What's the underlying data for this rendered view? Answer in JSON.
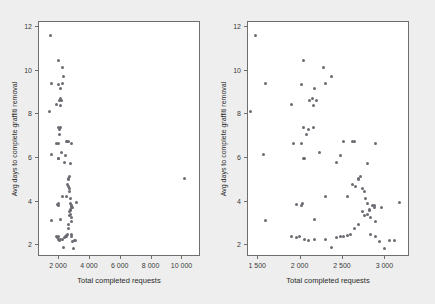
{
  "figure": {
    "background_color": "#eeeeee",
    "panel_background_color": "#ffffff",
    "point_color": "#6b6b73",
    "axis_color": "#6e6e6e"
  },
  "chart_data": [
    {
      "type": "scatter",
      "panel": "left",
      "title": "",
      "xlabel": "Total completed requests",
      "ylabel": "Avg days to complete graffiti removal",
      "xlim": [
        700,
        11200
      ],
      "ylim": [
        1.45,
        12.25
      ],
      "xticks": [
        2000,
        4000,
        6000,
        8000,
        10000
      ],
      "xtick_labels": [
        "2 000",
        "4 000",
        "6 000",
        "8 000",
        "10 000"
      ],
      "yticks": [
        2,
        4,
        6,
        8,
        10,
        12
      ],
      "ytick_labels": [
        "2",
        "4",
        "6",
        "8",
        "10",
        "12"
      ],
      "grid": false,
      "legend": "none",
      "x": [
        1480,
        1600,
        1420,
        1580,
        1900,
        2050,
        2020,
        2180,
        2280,
        2150,
        2120,
        2200,
        2160,
        2080,
        2020,
        2050,
        2300,
        2380,
        2050,
        2100,
        1930,
        2160,
        2240,
        2060,
        2480,
        2620,
        2650,
        2900,
        2440,
        2520,
        1600,
        1960,
        2020,
        2030,
        2180,
        2300,
        2560,
        2620,
        2700,
        2720,
        2740,
        2760,
        2700,
        2660,
        2780,
        2800,
        2820,
        2860,
        2880,
        2900,
        2740,
        2760,
        2800,
        2820,
        2840,
        2700,
        2650,
        2600,
        2560,
        2520,
        2480,
        2440,
        2380,
        2300,
        2180,
        2100,
        2060,
        2000,
        1960,
        1900,
        2840,
        2900,
        2940,
        3000,
        3060,
        3120,
        3180,
        2960,
        2880,
        2800,
        10200
      ],
      "y": [
        11.6,
        9.4,
        8.1,
        6.1,
        8.4,
        10.45,
        9.35,
        9.15,
        10.1,
        8.7,
        8.6,
        8.6,
        8.35,
        7.05,
        6.6,
        5.95,
        9.4,
        9.7,
        7.35,
        7.25,
        6.6,
        7.35,
        6.2,
        5.95,
        6.05,
        6.7,
        6.7,
        6.6,
        5.75,
        6.7,
        3.1,
        3.8,
        3.75,
        3.85,
        3.15,
        4.2,
        4.2,
        4.75,
        4.95,
        5.1,
        4.55,
        4.4,
        5.0,
        4.65,
        4.1,
        3.85,
        3.6,
        3.75,
        3.7,
        3.05,
        3.5,
        3.3,
        3.35,
        3.55,
        3.2,
        2.9,
        2.7,
        2.45,
        2.4,
        2.35,
        2.35,
        2.3,
        1.85,
        2.2,
        2.2,
        2.15,
        2.2,
        2.35,
        2.3,
        2.35,
        2.45,
        2.35,
        2.1,
        1.8,
        2.15,
        2.15,
        3.9,
        3.7,
        3.75,
        5.7,
        5.0
      ]
    },
    {
      "type": "scatter",
      "panel": "right",
      "title": "",
      "xlabel": "Total completed requests",
      "ylabel": "Avg days to complete graffiti removal",
      "xlim": [
        1380,
        3290
      ],
      "ylim": [
        1.45,
        12.25
      ],
      "xticks": [
        1500,
        2000,
        2500,
        3000
      ],
      "xtick_labels": [
        "1 500",
        "2 000",
        "2 500",
        "3 000"
      ],
      "yticks": [
        2,
        4,
        6,
        8,
        10,
        12
      ],
      "ytick_labels": [
        "2",
        "4",
        "6",
        "8",
        "10",
        "12"
      ],
      "grid": false,
      "legend": "none",
      "note": "same data as left panel, outlier at 10200 omitted by axis range",
      "x": [
        1480,
        1600,
        1420,
        1580,
        1900,
        2050,
        2020,
        2180,
        2280,
        2150,
        2120,
        2200,
        2160,
        2080,
        2020,
        2050,
        2300,
        2380,
        2050,
        2100,
        1930,
        2160,
        2240,
        2060,
        2480,
        2620,
        2650,
        2900,
        2440,
        2520,
        1600,
        1960,
        2020,
        2030,
        2180,
        2300,
        2560,
        2620,
        2700,
        2720,
        2740,
        2760,
        2700,
        2660,
        2780,
        2800,
        2820,
        2860,
        2880,
        2900,
        2740,
        2760,
        2800,
        2820,
        2840,
        2700,
        2650,
        2600,
        2560,
        2520,
        2480,
        2440,
        2380,
        2300,
        2180,
        2100,
        2060,
        2000,
        1960,
        1900,
        2840,
        2900,
        2940,
        3000,
        3060,
        3120,
        3180,
        2960,
        2880,
        2800
      ],
      "y": [
        11.6,
        9.4,
        8.1,
        6.1,
        8.4,
        10.45,
        9.35,
        9.15,
        10.1,
        8.7,
        8.6,
        8.6,
        8.35,
        7.05,
        6.6,
        5.95,
        9.4,
        9.7,
        7.35,
        7.25,
        6.6,
        7.35,
        6.2,
        5.95,
        6.05,
        6.7,
        6.7,
        6.6,
        5.75,
        6.7,
        3.1,
        3.8,
        3.75,
        3.85,
        3.15,
        4.2,
        4.2,
        4.75,
        4.95,
        5.1,
        4.55,
        4.4,
        5.0,
        4.65,
        4.1,
        3.85,
        3.6,
        3.75,
        3.7,
        3.05,
        3.5,
        3.3,
        3.35,
        3.55,
        3.2,
        2.9,
        2.7,
        2.45,
        2.4,
        2.35,
        2.35,
        2.3,
        1.85,
        2.2,
        2.2,
        2.15,
        2.2,
        2.35,
        2.3,
        2.35,
        2.45,
        2.35,
        2.1,
        1.8,
        2.15,
        2.15,
        3.9,
        3.7,
        3.75,
        5.7
      ]
    }
  ]
}
